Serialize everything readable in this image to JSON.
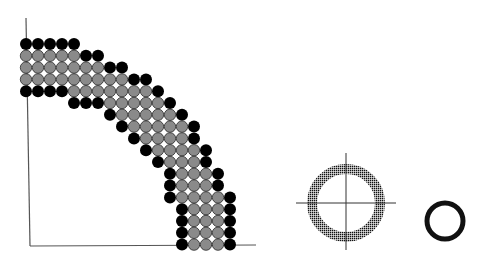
{
  "diagram": {
    "type": "circle-packing-quarter-annulus",
    "colors": {
      "background": "#ffffff",
      "boundary_circle": "#000000",
      "interior_circle": "#8a8a8a",
      "interior_outline": "#2a2a2a",
      "axis": "#555555",
      "ring": "#111111"
    },
    "grid": {
      "origin_x": 26,
      "origin_y": 44,
      "pitch_x": 12,
      "pitch_y": 11.8,
      "radius": 6,
      "rows": [
        {
          "black": [
            0,
            1,
            2,
            3,
            4
          ],
          "gray": []
        },
        {
          "black": [
            5,
            6
          ],
          "gray": [
            0,
            1,
            2,
            3,
            4
          ]
        },
        {
          "black": [
            7,
            8
          ],
          "gray": [
            0,
            1,
            2,
            3,
            4,
            5,
            6
          ]
        },
        {
          "black": [
            9,
            10
          ],
          "gray": [
            0,
            1,
            2,
            3,
            4,
            5,
            6,
            7,
            8
          ]
        },
        {
          "black": [
            0,
            1,
            2,
            3,
            11
          ],
          "gray": [
            4,
            5,
            6,
            7,
            8,
            9,
            10
          ]
        },
        {
          "black": [
            4,
            5,
            6,
            12
          ],
          "gray": [
            7,
            8,
            9,
            10,
            11
          ]
        },
        {
          "black": [
            7,
            13
          ],
          "gray": [
            8,
            9,
            10,
            11,
            12
          ]
        },
        {
          "black": [
            8,
            14
          ],
          "gray": [
            9,
            10,
            11,
            12,
            13
          ]
        },
        {
          "black": [
            9,
            14
          ],
          "gray": [
            10,
            11,
            12,
            13
          ]
        },
        {
          "black": [
            10,
            15
          ],
          "gray": [
            11,
            12,
            13,
            14
          ]
        },
        {
          "black": [
            11,
            15
          ],
          "gray": [
            12,
            13,
            14
          ]
        },
        {
          "black": [
            12,
            16
          ],
          "gray": [
            13,
            14,
            15
          ]
        },
        {
          "black": [
            12,
            16
          ],
          "gray": [
            13,
            14,
            15
          ]
        },
        {
          "black": [
            12,
            17
          ],
          "gray": [
            13,
            14,
            15,
            16
          ]
        },
        {
          "black": [
            13,
            17
          ],
          "gray": [
            14,
            15,
            16
          ]
        },
        {
          "black": [
            13,
            17
          ],
          "gray": [
            14,
            15,
            16
          ]
        },
        {
          "black": [
            13,
            17
          ],
          "gray": [
            14,
            15,
            16
          ]
        },
        {
          "black": [
            13,
            17
          ],
          "gray": [
            14,
            15,
            16
          ]
        }
      ]
    },
    "axes": {
      "vertical": {
        "x1": 26,
        "y1": 18,
        "x2": 30,
        "y2": 246
      },
      "horizontal": {
        "x1": 30,
        "y1": 246,
        "x2": 256,
        "y2": 245
      }
    },
    "large_ring": {
      "cx": 346,
      "cy": 203,
      "r_outer": 39,
      "r_inner": 29,
      "style": "halftone-dotted"
    },
    "crosshair": {
      "h": {
        "x1": 296,
        "x2": 396,
        "y": 203
      },
      "v": {
        "x": 346,
        "y1": 153,
        "y2": 250
      }
    },
    "small_ring": {
      "cx": 445,
      "cy": 221,
      "r": 18,
      "stroke_width": 5
    }
  }
}
